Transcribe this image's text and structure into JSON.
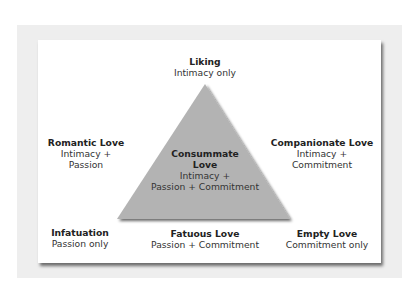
{
  "diagram": {
    "type": "love-triangle",
    "colors": {
      "background": "#ffffff",
      "outer_panel": "#eeeeee",
      "card": "#ffffff",
      "triangle_fill": "#b3b3b3",
      "text": "#222222"
    },
    "top": {
      "title": "Liking",
      "line1": "Intimacy only"
    },
    "left": {
      "title": "Romantic Love",
      "line1": "Intimacy +",
      "line2": "Passion"
    },
    "right": {
      "title": "Companionate Love",
      "line1": "Intimacy +",
      "line2": "Commitment"
    },
    "center": {
      "title_line1": "Consummate",
      "title_line2": "Love",
      "line1": "Intimacy +",
      "line2": "Passion + Commitment"
    },
    "bottom_left": {
      "title": "Infatuation",
      "line1": "Passion only"
    },
    "bottom_center": {
      "title": "Fatuous Love",
      "line1": "Passion + Commitment"
    },
    "bottom_right": {
      "title": "Empty Love",
      "line1": "Commitment only"
    }
  }
}
